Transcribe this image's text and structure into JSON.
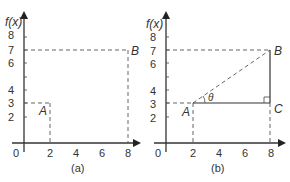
{
  "figure": {
    "panels": [
      {
        "id": "a",
        "caption": "(a)",
        "y_axis_label": "f(x)",
        "x_ticks": [
          "0",
          "2",
          "4",
          "6",
          "8"
        ],
        "y_ticks": [
          "2",
          "3",
          "4",
          "6",
          "7",
          "8"
        ],
        "points": [
          {
            "name": "A",
            "x": 2,
            "y": 3
          },
          {
            "name": "B",
            "x": 8,
            "y": 7
          }
        ]
      },
      {
        "id": "b",
        "caption": "(b)",
        "y_axis_label": "f(x)",
        "x_ticks": [
          "0",
          "2",
          "4",
          "6",
          "8"
        ],
        "y_ticks": [
          "2",
          "3",
          "4",
          "6",
          "7",
          "8"
        ],
        "points": [
          {
            "name": "A",
            "x": 2,
            "y": 3
          },
          {
            "name": "B",
            "x": 8,
            "y": 7
          },
          {
            "name": "C",
            "x": 8,
            "y": 3
          }
        ],
        "angle_label": "θ",
        "segments": [
          "AB (dashed hypotenuse)",
          "AC (horizontal)",
          "CB (vertical)"
        ],
        "right_angle_at": "C"
      }
    ]
  },
  "labels": {
    "a": {
      "fx": "f(x)",
      "A": "A",
      "B": "B",
      "cap": "(a)",
      "x0": "0",
      "x2": "2",
      "x4": "4",
      "x6": "6",
      "x8": "8",
      "y2": "2",
      "y3": "3",
      "y4": "4",
      "y6": "6",
      "y7": "7",
      "y8": "8"
    },
    "b": {
      "fx": "f(x)",
      "A": "A",
      "B": "B",
      "C": "C",
      "theta": "θ",
      "cap": "(b)",
      "x0": "0",
      "x2": "2",
      "x4": "4",
      "x6": "6",
      "x8": "8",
      "y2": "2",
      "y3": "3",
      "y4": "4",
      "y6": "6",
      "y7": "7",
      "y8": "8"
    }
  }
}
